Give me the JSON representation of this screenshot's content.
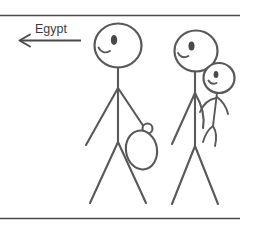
{
  "illustration": {
    "title": "Two stick figures walking toward Egypt",
    "background_color": "#ffffff",
    "stroke_color": "#595959",
    "rule_color": "#4a4a4a",
    "text_color": "#3c3c3c"
  },
  "direction_marker": {
    "label": "Egypt",
    "arrow_icon": "arrow-left-icon",
    "points": "left"
  },
  "figures": [
    {
      "name": "adult-with-bag",
      "description": "Tall stick figure facing left, smiling, carrying a bag in the right hand",
      "carries": "bag"
    },
    {
      "name": "adult-with-child",
      "description": "Stick figure facing left, smiling, carrying a small child on the hip",
      "carries": "child"
    }
  ],
  "frame": {
    "top_rule": "top-divider",
    "bottom_rule": "bottom-divider"
  }
}
